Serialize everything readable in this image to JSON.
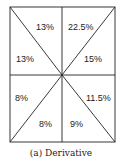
{
  "diagram": {
    "regions": [
      {
        "id": "top-left-upper",
        "label": "13%"
      },
      {
        "id": "top-right-upper",
        "label": "22.5%"
      },
      {
        "id": "left-upper",
        "label": "13%"
      },
      {
        "id": "right-upper",
        "label": "15%"
      },
      {
        "id": "left-lower",
        "label": "8%"
      },
      {
        "id": "right-lower",
        "label": "11.5%"
      },
      {
        "id": "bottom-left-lower",
        "label": "8%"
      },
      {
        "id": "bottom-right-lower",
        "label": "9%"
      }
    ],
    "caption": "(a) Derivative",
    "line_color": "#222222"
  }
}
